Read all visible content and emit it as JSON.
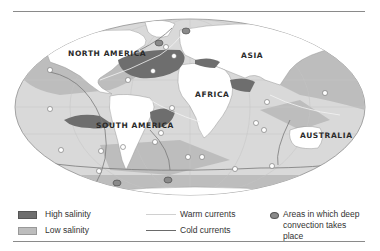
{
  "map": {
    "projection": "elliptical world map",
    "continent_labels": [
      {
        "id": "north-america",
        "label": "NORTH AMERICA",
        "x": 68,
        "y": 55
      },
      {
        "id": "asia",
        "label": "ASIA",
        "x": 241,
        "y": 57
      },
      {
        "id": "africa",
        "label": "AFRICA",
        "x": 195,
        "y": 96
      },
      {
        "id": "south-america",
        "label": "SOUTH AMERICA",
        "x": 96,
        "y": 128
      },
      {
        "id": "australia",
        "label": "AUSTRALIA",
        "x": 300,
        "y": 137
      }
    ],
    "colors": {
      "ocean": "#d9d9d9",
      "low_salinity": "#bdbdbd",
      "high_salinity": "#6e6e6e",
      "land": "#ffffff",
      "land_outline": "#9a9a9a",
      "warm_current": "#f2f2f2",
      "cold_current": "#7a7a7a",
      "convection": "#8a8a8a"
    }
  },
  "legend": {
    "high_salinity": "High salinity",
    "low_salinity": "Low salinity",
    "warm_currents": "Warm currents",
    "cold_currents": "Cold currents",
    "convection": "Areas in which deep convection takes place"
  }
}
